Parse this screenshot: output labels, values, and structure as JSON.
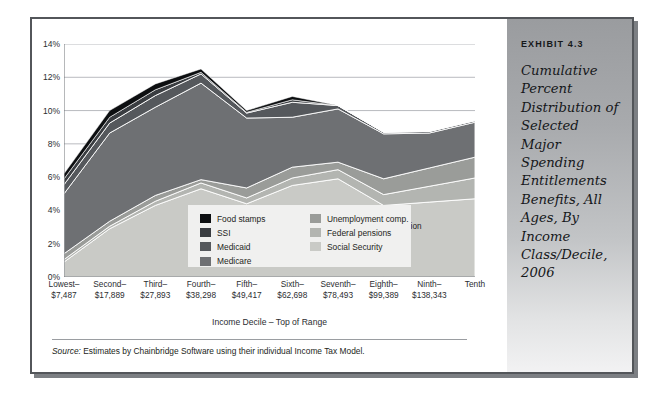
{
  "exhibit": {
    "label": "EXHIBIT 4.3",
    "caption": "Cumulative Percent Distribution of Selected Major Spending Entitlements Benefits, All Ages, By Income Class/Decile, 2006"
  },
  "source": {
    "prefix": "Source:",
    "text": " Estimates by Chainbridge Software using their individual Income Tax Model."
  },
  "chart_data": {
    "type": "area",
    "stacked": true,
    "title": "Cumulative Percent Distribution of Selected Major Spending Entitlements Benefits, All Ages, By Income Class/Decile, 2006",
    "annotation": "Total spending included = $1.1 trillion",
    "xlabel": "Income Decile – Top of Range",
    "ylabel": "",
    "ylim": [
      0,
      14
    ],
    "yticks": [
      "0%",
      "2%",
      "4%",
      "6%",
      "8%",
      "10%",
      "12%",
      "14%"
    ],
    "ytick_values": [
      0,
      2,
      4,
      6,
      8,
      10,
      12,
      14
    ],
    "grid": true,
    "legend_position": "inside-center",
    "categories": [
      "Lowest–\n$7,487",
      "Second–\n$17,889",
      "Third–\n$27,893",
      "Fourth–\n$38,298",
      "Fifth–\n$49,417",
      "Sixth–\n$62,698",
      "Seventh–\n$78,493",
      "Eighth–\n$99,389",
      "Ninth–\n$138,343",
      "Tenth"
    ],
    "category_names": [
      "Lowest",
      "Second",
      "Third",
      "Fourth",
      "Fifth",
      "Sixth",
      "Seventh",
      "Eighth",
      "Ninth",
      "Tenth"
    ],
    "category_values": [
      "$7,487",
      "$17,889",
      "$27,893",
      "$38,298",
      "$49,417",
      "$62,698",
      "$78,493",
      "$99,389",
      "$138,343",
      ""
    ],
    "series": [
      {
        "name": "Social Security",
        "color": "#c9cac6",
        "values": [
          0.9,
          2.9,
          4.3,
          5.3,
          4.4,
          5.5,
          5.9,
          4.3,
          4.5,
          4.7
        ]
      },
      {
        "name": "Federal pensions",
        "color": "#b3b5b1",
        "values": [
          0.15,
          0.15,
          0.25,
          0.35,
          0.35,
          0.45,
          0.55,
          0.65,
          0.95,
          1.25
        ]
      },
      {
        "name": "Unemployment comp.",
        "color": "#9a9c99",
        "values": [
          0.35,
          0.3,
          0.35,
          0.2,
          0.6,
          0.65,
          0.45,
          0.95,
          1.1,
          1.25
        ]
      },
      {
        "name": "Medicare",
        "color": "#6e7073",
        "values": [
          3.6,
          5.3,
          5.3,
          5.8,
          4.2,
          3.0,
          3.2,
          2.7,
          2.1,
          2.1
        ]
      },
      {
        "name": "Medicaid",
        "color": "#55585c",
        "values": [
          0.55,
          0.6,
          0.7,
          0.55,
          0.3,
          0.9,
          0.2,
          0.1,
          0.1,
          0.1
        ]
      },
      {
        "name": "SSI",
        "color": "#3a3d41",
        "values": [
          0.35,
          0.35,
          0.35,
          0.1,
          0.05,
          0.15,
          0.0,
          0.0,
          0.0,
          0.0
        ]
      },
      {
        "name": "Food stamps",
        "color": "#0d0f11",
        "values": [
          0.3,
          0.4,
          0.35,
          0.2,
          0.1,
          0.2,
          0.0,
          0.0,
          0.0,
          0.0
        ]
      }
    ],
    "cumulative_totals": [
      6.2,
      10.0,
      11.6,
      12.5,
      10.0,
      10.9,
      10.3,
      8.7,
      8.8,
      9.4
    ]
  },
  "legend": {
    "left_column": [
      {
        "label": "Food stamps",
        "color": "#0d0f11"
      },
      {
        "label": "SSI",
        "color": "#3a3d41"
      },
      {
        "label": "Medicaid",
        "color": "#55585c"
      },
      {
        "label": "Medicare",
        "color": "#6e7073"
      }
    ],
    "right_column": [
      {
        "label": "Unemployment comp.",
        "color": "#9a9c99"
      },
      {
        "label": "Federal pensions",
        "color": "#b3b5b1"
      },
      {
        "label": "Social Security",
        "color": "#c9cac6"
      }
    ]
  }
}
